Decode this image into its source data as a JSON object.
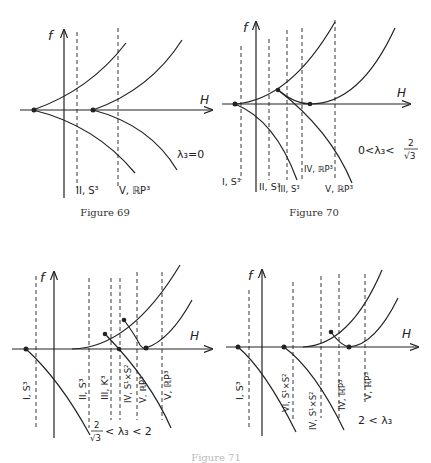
{
  "figures": [
    {
      "id": "fig69",
      "caption": "Figure 69",
      "axis_f": "f",
      "axis_H": "H",
      "condition": "λ₃=0",
      "separatrix_labels": [
        "II, S³",
        "V, ℝP³"
      ]
    },
    {
      "id": "fig70",
      "caption": "Figure 70",
      "axis_f": "f",
      "axis_H": "H",
      "condition_left": "0<λ₃<",
      "condition_num": "2",
      "condition_den": "√3",
      "separatrix_labels": [
        "I, S³",
        "II, S³",
        "III, S³",
        "IV, ℝP³",
        "V, ℝP³"
      ]
    },
    {
      "id": "fig71a",
      "axis_f": "f",
      "axis_H": "H",
      "condition_num": "2",
      "condition_den": "√3",
      "condition_right": "< λ₃ < 2",
      "separatrix_labels": [
        "I, S³",
        "II, S³",
        "III, K³",
        "IV, S¹×S²",
        "V, ℝP³",
        "V, ℝP³"
      ]
    },
    {
      "id": "fig71b",
      "axis_f": "f",
      "axis_H": "H",
      "condition": "2 < λ₃",
      "separatrix_labels": [
        "I, S³",
        "VI, S¹×S²",
        "IV, S¹×S²",
        "IV, ℝP³",
        "V, ℝP³"
      ]
    }
  ],
  "shared_caption": "Figure 71"
}
